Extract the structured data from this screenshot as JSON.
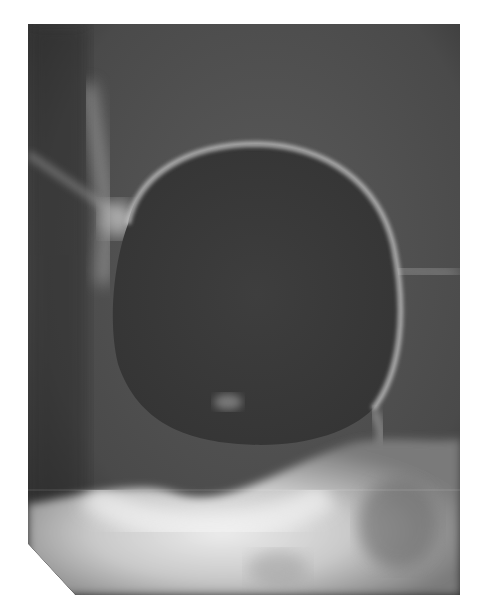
{
  "image": {
    "kind": "radiograph",
    "description": "Grayscale X-ray showing a large rounded radiolucent lesion with a thin sclerotic rim above a dense bony base",
    "colors": {
      "background": "#ffffff",
      "film_base": "#4a4a4a",
      "lesion_interior": "#3c3c3c",
      "rim": "#bdbdbd",
      "dense_bone": "#e4e4e4"
    }
  }
}
